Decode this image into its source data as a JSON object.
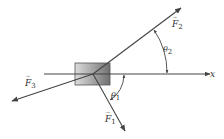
{
  "diagram": {
    "type": "free-body force diagram",
    "axis": {
      "label": "x"
    },
    "forces": [
      {
        "name": "F",
        "sub": "1",
        "arrow": "→"
      },
      {
        "name": "F",
        "sub": "2",
        "arrow": "→"
      },
      {
        "name": "F",
        "sub": "3",
        "arrow": "→"
      }
    ],
    "angles": [
      {
        "name": "θ",
        "sub": "1"
      },
      {
        "name": "θ",
        "sub": "2"
      }
    ],
    "colors": {
      "line": "#444444",
      "box_light": "#d8d8d8",
      "box_dark": "#7a7a7a"
    }
  }
}
